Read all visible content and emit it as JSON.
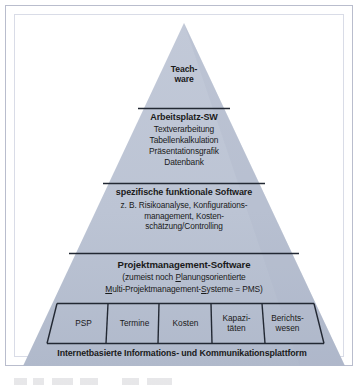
{
  "figure": {
    "type": "pyramid-diagram",
    "language": "de",
    "colors": {
      "pyramid_fill": "#bcc4d4",
      "pyramid_fill_bottom": "#b2bbcd",
      "divider_line": "#1f2430",
      "frame_border": "#b9bdcd",
      "text": "#1a1a1a",
      "page_background": "#ffffff"
    }
  },
  "tiers": [
    {
      "id": "teachware",
      "level": 1,
      "heading_lines": [
        "Teach-",
        "ware"
      ],
      "body_lines": []
    },
    {
      "id": "arbeitsplatz-sw",
      "level": 2,
      "heading": "Arbeitsplatz-SW",
      "body_lines": [
        "Textverarbeitung",
        "Tabellenkalkulation",
        "Präsentationsgrafik",
        "Datenbank"
      ]
    },
    {
      "id": "spezifische-funktionale-software",
      "level": 3,
      "heading": "spezifische funktionale Software",
      "body_lines": [
        "z. B. Risikoanalyse, Konfigurations-",
        "management, Kosten-",
        "schätzung/Controlling"
      ]
    },
    {
      "id": "projektmanagement-software",
      "level": 4,
      "heading": "Projektmanagement-Software",
      "body_line_1_pre": "(zumeist noch ",
      "body_line_1_underlined": "P",
      "body_line_1_post": "lanungsorientierte",
      "body_line_2_u1": "M",
      "body_line_2_mid1": "ulti-Projektmanagement-",
      "body_line_2_u2": "S",
      "body_line_2_mid2": "ysteme = PMS)"
    }
  ],
  "function_cells": [
    {
      "id": "psp",
      "lines": [
        "PSP"
      ]
    },
    {
      "id": "termine",
      "lines": [
        "Termine"
      ]
    },
    {
      "id": "kosten",
      "lines": [
        "Kosten"
      ]
    },
    {
      "id": "kapazitaeten",
      "lines": [
        "Kapazi-",
        "täten"
      ]
    },
    {
      "id": "berichtswesen",
      "lines": [
        "Berichts-",
        "wesen"
      ]
    }
  ],
  "base": {
    "id": "plattform",
    "heading": "Internetbasierte Informations- und Kommunikationsplattform"
  }
}
